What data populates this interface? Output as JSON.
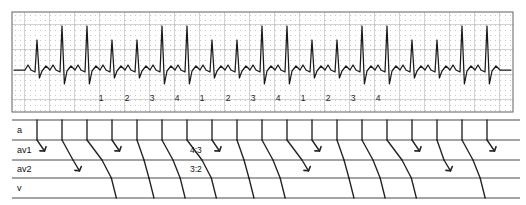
{
  "figure": {
    "type": "ecg-ladder-diagram",
    "title": "",
    "background_color": "#ffffff",
    "trace_color": "#1a1a1a",
    "grid_major_color": "#9a9a9a",
    "grid_minor_color": "#cfcfcf",
    "ladder_line_color": "#222222"
  },
  "ecg_panel": {
    "name": "ecg-rhythm-strip",
    "x": 12,
    "y": 12,
    "width": 501,
    "height": 100,
    "grid": {
      "major_spacing_px": 25,
      "minor_spacing_px": 5,
      "minor_style": "dotted",
      "show_grid": true
    },
    "baseline_y": 70,
    "beat_labels": [
      {
        "text": "1",
        "x": 101
      },
      {
        "text": "2",
        "x": 127
      },
      {
        "text": "3",
        "x": 152
      },
      {
        "text": "4",
        "x": 177
      },
      {
        "text": "1",
        "x": 202
      },
      {
        "text": "2",
        "x": 228
      },
      {
        "text": "3",
        "x": 253
      },
      {
        "text": "4",
        "x": 278
      },
      {
        "text": "1",
        "x": 303
      },
      {
        "text": "2",
        "x": 328
      },
      {
        "text": "3",
        "x": 353
      },
      {
        "text": "4",
        "x": 378
      }
    ],
    "beat_label_y": 101
  },
  "ladder_panel": {
    "name": "ladder-diagram",
    "x": 12,
    "y": 120,
    "width": 508,
    "height": 78,
    "tiers": [
      {
        "key": "a",
        "label": "a",
        "top": 120,
        "bottom": 140
      },
      {
        "key": "av1",
        "label": "av1",
        "top": 140,
        "bottom": 160
      },
      {
        "key": "av2",
        "label": "av2",
        "top": 160,
        "bottom": 178
      },
      {
        "key": "v",
        "label": "v",
        "top": 178,
        "bottom": 198
      }
    ],
    "tier_label_x": 17,
    "annotations": [
      {
        "text": "4:3",
        "x": 190,
        "y": 153
      },
      {
        "text": "3:2",
        "x": 190,
        "y": 172
      }
    ],
    "atrial_beats_x": [
      37,
      62,
      87,
      112,
      137,
      162,
      187,
      212,
      237,
      262,
      287,
      312,
      337,
      362,
      387,
      412,
      437,
      462,
      487
    ],
    "conducted_description": "Wenckebach-type conduction in two AV layers with progressive delay and periodic block",
    "block_markers_av1_x": [
      37,
      112,
      212,
      312,
      412,
      487
    ],
    "block_markers_av2_x": [
      62,
      287,
      437
    ]
  }
}
